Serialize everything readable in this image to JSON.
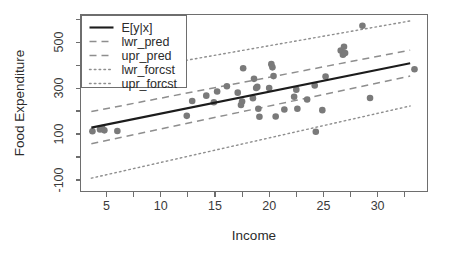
{
  "chart_data": {
    "type": "scatter",
    "title": "",
    "xlabel": "Income",
    "ylabel": "Food Expenditure",
    "xlim": [
      2.6,
      34.6
    ],
    "ylim": [
      -150,
      620
    ],
    "grid": false,
    "legend_position": "top-left",
    "xticks": [
      5,
      10,
      15,
      20,
      25,
      30
    ],
    "xtick_labels": [
      "5",
      "10",
      "15",
      "20",
      "25",
      "30"
    ],
    "xminor_ticks": [
      7.5,
      12.5,
      17.5,
      22.5,
      27.5,
      32.5
    ],
    "yticks": [
      -100,
      100,
      300,
      500
    ],
    "ytick_labels": [
      "-100",
      "100",
      "300",
      "500"
    ],
    "yminor_ticks": [
      -200,
      0,
      200,
      400,
      600
    ],
    "points": [
      {
        "x": 3.7,
        "y": 112
      },
      {
        "x": 4.4,
        "y": 120
      },
      {
        "x": 4.6,
        "y": 126
      },
      {
        "x": 4.8,
        "y": 116
      },
      {
        "x": 6.0,
        "y": 113
      },
      {
        "x": 12.4,
        "y": 179
      },
      {
        "x": 12.9,
        "y": 244
      },
      {
        "x": 14.2,
        "y": 267
      },
      {
        "x": 14.9,
        "y": 238
      },
      {
        "x": 15.2,
        "y": 285
      },
      {
        "x": 16.1,
        "y": 308
      },
      {
        "x": 17.1,
        "y": 280
      },
      {
        "x": 17.4,
        "y": 226
      },
      {
        "x": 17.5,
        "y": 241
      },
      {
        "x": 17.6,
        "y": 386
      },
      {
        "x": 18.5,
        "y": 256
      },
      {
        "x": 18.6,
        "y": 340
      },
      {
        "x": 18.8,
        "y": 300
      },
      {
        "x": 18.9,
        "y": 305
      },
      {
        "x": 19.0,
        "y": 210
      },
      {
        "x": 19.1,
        "y": 175
      },
      {
        "x": 20.0,
        "y": 300
      },
      {
        "x": 20.2,
        "y": 404
      },
      {
        "x": 20.3,
        "y": 390
      },
      {
        "x": 20.4,
        "y": 352
      },
      {
        "x": 20.6,
        "y": 176
      },
      {
        "x": 21.4,
        "y": 207
      },
      {
        "x": 22.3,
        "y": 262
      },
      {
        "x": 22.5,
        "y": 293
      },
      {
        "x": 22.6,
        "y": 210
      },
      {
        "x": 23.5,
        "y": 250
      },
      {
        "x": 24.2,
        "y": 311
      },
      {
        "x": 24.3,
        "y": 110
      },
      {
        "x": 24.9,
        "y": 204
      },
      {
        "x": 25.2,
        "y": 350
      },
      {
        "x": 26.6,
        "y": 463
      },
      {
        "x": 26.8,
        "y": 445
      },
      {
        "x": 26.9,
        "y": 480
      },
      {
        "x": 27.0,
        "y": 452
      },
      {
        "x": 28.6,
        "y": 571
      },
      {
        "x": 29.3,
        "y": 257
      },
      {
        "x": 33.4,
        "y": 382
      }
    ],
    "series": [
      {
        "name": "E[y|x]",
        "style": "solid",
        "color": "#1c1c1c",
        "x": [
          3.6,
          33.0
        ],
        "y": [
          128,
          408
        ]
      },
      {
        "name": "lwr_pred",
        "style": "dashed",
        "color": "#8e8e8e",
        "x": [
          3.6,
          33.0
        ],
        "y": [
          58,
          352
        ]
      },
      {
        "name": "upr_pred",
        "style": "dashed",
        "color": "#8e8e8e",
        "x": [
          3.6,
          33.0
        ],
        "y": [
          198,
          465
        ]
      },
      {
        "name": "lwr_forcst",
        "style": "dotted",
        "color": "#8e8e8e",
        "x": [
          3.6,
          33.0
        ],
        "y": [
          -92,
          222
        ]
      },
      {
        "name": "upr_forcst",
        "style": "dotted",
        "color": "#8e8e8e",
        "x": [
          3.6,
          33.0
        ],
        "y": [
          348,
          592
        ]
      }
    ],
    "legend": [
      {
        "label": "E[y|x]",
        "style": "solid"
      },
      {
        "label": "lwr_pred",
        "style": "dashed"
      },
      {
        "label": "upr_pred",
        "style": "dashed"
      },
      {
        "label": "lwr_forcst",
        "style": "dotted"
      },
      {
        "label": "upr_forcst",
        "style": "dotted"
      }
    ]
  }
}
